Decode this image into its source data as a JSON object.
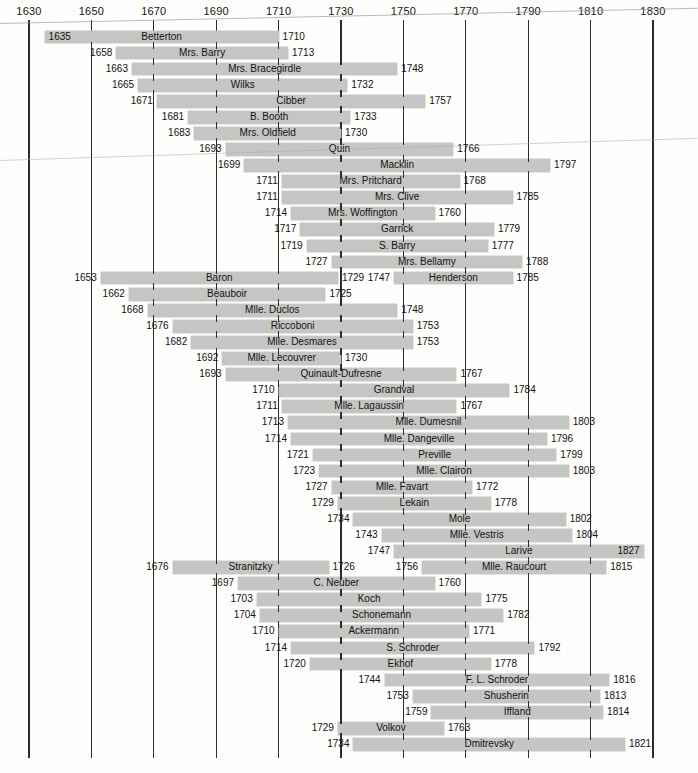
{
  "colors": {
    "bar_fill": "#c5c6c4",
    "gridline": "#2d2d2d",
    "text": "#141414",
    "background": "#fdfdfc"
  },
  "chart_data": {
    "type": "bar",
    "subtype": "timeline-gantt-lifespans",
    "title": "",
    "xlabel": "",
    "ylabel": "",
    "x_axis": {
      "range": [
        1630,
        1830
      ],
      "ticks": [
        1630,
        1650,
        1670,
        1690,
        1710,
        1730,
        1750,
        1770,
        1790,
        1810,
        1830
      ],
      "grid": true,
      "position": "top"
    },
    "rows": [
      [
        {
          "name": "Betterton",
          "start": 1635,
          "end": 1710,
          "start_label_inside": true
        }
      ],
      [
        {
          "name": "Mrs. Barry",
          "start": 1658,
          "end": 1713
        }
      ],
      [
        {
          "name": "Mrs. Bracegirdle",
          "start": 1663,
          "end": 1748
        }
      ],
      [
        {
          "name": "Wilks",
          "start": 1665,
          "end": 1732
        }
      ],
      [
        {
          "name": "Cibber",
          "start": 1671,
          "end": 1757
        }
      ],
      [
        {
          "name": "B. Booth",
          "start": 1681,
          "end": 1733
        }
      ],
      [
        {
          "name": "Mrs. Oldfield",
          "start": 1683,
          "end": 1730
        }
      ],
      [
        {
          "name": "Quin",
          "start": 1693,
          "end": 1766
        }
      ],
      [
        {
          "name": "Macklin",
          "start": 1699,
          "end": 1797
        }
      ],
      [
        {
          "name": "Mrs. Pritchard",
          "start": 1711,
          "end": 1768
        }
      ],
      [
        {
          "name": "Mrs. Clive",
          "start": 1711,
          "end": 1785
        }
      ],
      [
        {
          "name": "Mrs. Woffington",
          "start": 1714,
          "end": 1760
        }
      ],
      [
        {
          "name": "Garrick",
          "start": 1717,
          "end": 1779
        }
      ],
      [
        {
          "name": "S. Barry",
          "start": 1719,
          "end": 1777
        }
      ],
      [
        {
          "name": "Mrs. Bellamy",
          "start": 1727,
          "end": 1788
        }
      ],
      [
        {
          "name": "Baron",
          "start": 1653,
          "end": 1729
        },
        {
          "name": "Henderson",
          "start": 1747,
          "end": 1785
        }
      ],
      [
        {
          "name": "Beauboir",
          "start": 1662,
          "end": 1725
        }
      ],
      [
        {
          "name": "Mlle. Duclos",
          "start": 1668,
          "end": 1748
        }
      ],
      [
        {
          "name": "Riccoboni",
          "start": 1676,
          "end": 1753
        }
      ],
      [
        {
          "name": "Mlle. Desmares",
          "start": 1682,
          "end": 1753
        }
      ],
      [
        {
          "name": "Mlle. Lecouvrer",
          "start": 1692,
          "end": 1730
        }
      ],
      [
        {
          "name": "Quinault-Dufresne",
          "start": 1693,
          "end": 1767
        }
      ],
      [
        {
          "name": "Grandval",
          "start": 1710,
          "end": 1784
        }
      ],
      [
        {
          "name": "Mlle. Lagaussin",
          "start": 1711,
          "end": 1767
        }
      ],
      [
        {
          "name": "Mlle. Dumesnil",
          "start": 1713,
          "end": 1803
        }
      ],
      [
        {
          "name": "Mlle. Dangeville",
          "start": 1714,
          "end": 1796
        }
      ],
      [
        {
          "name": "Preville",
          "start": 1721,
          "end": 1799
        }
      ],
      [
        {
          "name": "Mlle. Clairon",
          "start": 1723,
          "end": 1803
        }
      ],
      [
        {
          "name": "Mlle. Favart",
          "start": 1727,
          "end": 1772
        }
      ],
      [
        {
          "name": "Lekain",
          "start": 1729,
          "end": 1778
        }
      ],
      [
        {
          "name": "Mole",
          "start": 1734,
          "end": 1802
        }
      ],
      [
        {
          "name": "Mlle. Vestris",
          "start": 1743,
          "end": 1804
        }
      ],
      [
        {
          "name": "Larive",
          "start": 1747,
          "end": 1827,
          "end_label_inside": true
        }
      ],
      [
        {
          "name": "Stranitzky",
          "start": 1676,
          "end": 1726
        },
        {
          "name": "Mlle. Raucourt",
          "start": 1756,
          "end": 1815
        }
      ],
      [
        {
          "name": "C. Neuber",
          "start": 1697,
          "end": 1760
        }
      ],
      [
        {
          "name": "Koch",
          "start": 1703,
          "end": 1775
        }
      ],
      [
        {
          "name": "Schonemann",
          "start": 1704,
          "end": 1782
        }
      ],
      [
        {
          "name": "Ackermann",
          "start": 1710,
          "end": 1771
        }
      ],
      [
        {
          "name": "S. Schroder",
          "start": 1714,
          "end": 1792
        }
      ],
      [
        {
          "name": "Ekhof",
          "start": 1720,
          "end": 1778
        }
      ],
      [
        {
          "name": "F. L. Schroder",
          "start": 1744,
          "end": 1816
        }
      ],
      [
        {
          "name": "Shusherin",
          "start": 1753,
          "end": 1813
        }
      ],
      [
        {
          "name": "Iffland",
          "start": 1759,
          "end": 1814
        }
      ],
      [
        {
          "name": "Volkov",
          "start": 1729,
          "end": 1763
        }
      ],
      [
        {
          "name": "Dmitrevsky",
          "start": 1734,
          "end": 1821
        }
      ]
    ]
  }
}
